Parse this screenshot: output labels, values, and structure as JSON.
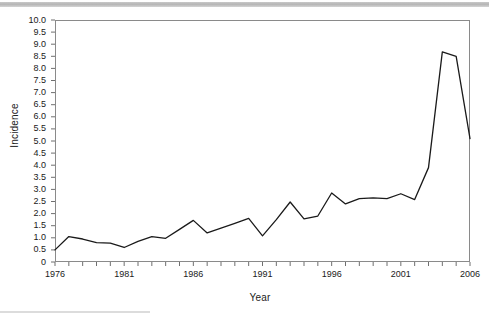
{
  "figure": {
    "background_color": "#ffffff",
    "top_bar_color": "#bdbdbd",
    "frame_color": "#8a8a8a",
    "line_color": "#1a1a1a"
  },
  "chart_data": {
    "type": "line",
    "title": "",
    "xlabel": "Year",
    "ylabel": "Incidence",
    "xlim": [
      1976,
      2006
    ],
    "ylim": [
      0,
      10
    ],
    "grid": false,
    "legend": null,
    "y_ticks": [
      0,
      0.5,
      1.0,
      1.5,
      2.0,
      2.5,
      3.0,
      3.5,
      4.0,
      4.5,
      5.0,
      5.5,
      6.0,
      6.5,
      7.0,
      7.5,
      8.0,
      8.5,
      9.0,
      9.5,
      10.0
    ],
    "y_tick_labels": [
      "0",
      "0.5",
      "1.0",
      "1.5",
      "2.0",
      "2.5",
      "3.0",
      "3.5",
      "4.0",
      "4.5",
      "5.0",
      "5.5",
      "6.0",
      "6.5",
      "7.0",
      "7.5",
      "8.0",
      "8.5",
      "9.0",
      "9.5",
      "10.0"
    ],
    "x_ticks": [
      1976,
      1977,
      1978,
      1979,
      1980,
      1981,
      1982,
      1983,
      1984,
      1985,
      1986,
      1987,
      1988,
      1989,
      1990,
      1991,
      1992,
      1993,
      1994,
      1995,
      1996,
      1997,
      1998,
      1999,
      2000,
      2001,
      2002,
      2003,
      2004,
      2005,
      2006
    ],
    "x_tick_labels_shown": [
      "1976",
      "1981",
      "1986",
      "1991",
      "1996",
      "2001",
      "2006"
    ],
    "x": [
      1976,
      1977,
      1978,
      1979,
      1980,
      1981,
      1982,
      1983,
      1984,
      1985,
      1986,
      1987,
      1988,
      1989,
      1990,
      1991,
      1992,
      1993,
      1994,
      1995,
      1996,
      1997,
      1998,
      1999,
      2000,
      2001,
      2002,
      2003,
      2004,
      2005,
      2006
    ],
    "values": [
      0.5,
      1.05,
      0.95,
      0.8,
      0.78,
      0.6,
      0.85,
      1.05,
      0.98,
      1.35,
      1.72,
      1.2,
      1.4,
      1.6,
      1.8,
      1.08,
      1.75,
      2.48,
      1.78,
      1.9,
      2.85,
      2.4,
      2.62,
      2.65,
      2.62,
      2.82,
      2.58,
      3.9,
      8.68,
      8.5,
      5.1
    ]
  }
}
